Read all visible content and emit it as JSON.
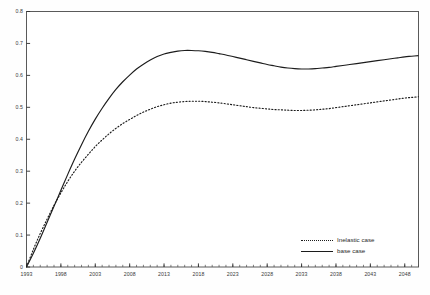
{
  "chart_data": {
    "type": "line",
    "title": "",
    "xlabel": "",
    "ylabel": "",
    "xlim": [
      1993,
      2050
    ],
    "ylim": [
      0,
      0.8
    ],
    "grid": false,
    "legend_position": "bottom-right",
    "y_ticks": [
      "0",
      "0.1",
      "0.2",
      "0.3",
      "0.4",
      "0.5",
      "0.6",
      "0.7",
      "0.8"
    ],
    "y_tick_values": [
      0,
      0.1,
      0.2,
      0.3,
      0.4,
      0.5,
      0.6,
      0.7,
      0.8
    ],
    "x_ticks": [
      "1993",
      "1998",
      "2003",
      "2008",
      "2013",
      "2018",
      "2023",
      "2028",
      "2033",
      "2038",
      "2043",
      "2048"
    ],
    "x_tick_values": [
      1993,
      1998,
      2003,
      2008,
      2013,
      2018,
      2023,
      2028,
      2033,
      2038,
      2043,
      2048
    ],
    "x_minor_tick_interval": 1,
    "x": [
      1993,
      1994,
      1995,
      1996,
      1997,
      1998,
      1999,
      2000,
      2001,
      2002,
      2003,
      2004,
      2005,
      2006,
      2007,
      2008,
      2009,
      2010,
      2011,
      2012,
      2013,
      2014,
      2015,
      2016,
      2017,
      2018,
      2019,
      2020,
      2021,
      2022,
      2023,
      2024,
      2025,
      2026,
      2027,
      2028,
      2029,
      2030,
      2031,
      2032,
      2033,
      2034,
      2035,
      2036,
      2037,
      2038,
      2039,
      2040,
      2041,
      2042,
      2043,
      2044,
      2045,
      2046,
      2047,
      2048,
      2049,
      2050
    ],
    "series": [
      {
        "name": "Inelastic case",
        "style": "dotted",
        "color": "#1c1c1c",
        "values": [
          0.0,
          0.055,
          0.105,
          0.15,
          0.193,
          0.232,
          0.268,
          0.3,
          0.328,
          0.353,
          0.377,
          0.398,
          0.417,
          0.434,
          0.449,
          0.462,
          0.474,
          0.485,
          0.494,
          0.502,
          0.508,
          0.513,
          0.516,
          0.518,
          0.519,
          0.519,
          0.518,
          0.516,
          0.514,
          0.511,
          0.508,
          0.505,
          0.502,
          0.499,
          0.497,
          0.495,
          0.493,
          0.492,
          0.491,
          0.49,
          0.49,
          0.491,
          0.492,
          0.494,
          0.496,
          0.499,
          0.502,
          0.505,
          0.508,
          0.511,
          0.514,
          0.517,
          0.52,
          0.523,
          0.526,
          0.529,
          0.531,
          0.533
        ]
      },
      {
        "name": "base case",
        "style": "solid",
        "color": "#1c1c1c",
        "values": [
          0.0,
          0.043,
          0.09,
          0.14,
          0.19,
          0.24,
          0.29,
          0.338,
          0.383,
          0.425,
          0.463,
          0.497,
          0.528,
          0.556,
          0.58,
          0.601,
          0.62,
          0.635,
          0.648,
          0.659,
          0.667,
          0.672,
          0.676,
          0.678,
          0.678,
          0.677,
          0.675,
          0.672,
          0.668,
          0.664,
          0.659,
          0.654,
          0.649,
          0.644,
          0.639,
          0.634,
          0.63,
          0.626,
          0.623,
          0.621,
          0.62,
          0.62,
          0.621,
          0.623,
          0.625,
          0.628,
          0.631,
          0.634,
          0.637,
          0.64,
          0.643,
          0.646,
          0.649,
          0.652,
          0.655,
          0.658,
          0.66,
          0.662
        ]
      }
    ]
  },
  "legend": {
    "items": [
      {
        "label": "Inelastic case",
        "style": "dotted"
      },
      {
        "label": "base case",
        "style": "solid"
      }
    ]
  }
}
